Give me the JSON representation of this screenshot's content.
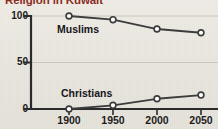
{
  "figure": {
    "title": "Religion in Kuwait",
    "title_color": "#8a2d24",
    "background_color": "#eceae2",
    "line_color": "#3c3c3c",
    "marker_fill": "#ffffff",
    "axis_color": "#2b2b2b",
    "gridline_color": "#c9c5ba"
  },
  "axes": {
    "y_ticks": [
      "0",
      "50",
      "100"
    ],
    "x_ticks": [
      "1900",
      "1950",
      "2000",
      "2050"
    ]
  },
  "series_labels": {
    "muslims": "Muslims",
    "christians": "Christians"
  },
  "chart_data": {
    "type": "line",
    "title": "Religion in Kuwait",
    "xlabel": "",
    "ylabel": "",
    "x": [
      1900,
      1950,
      2000,
      2050
    ],
    "categories": [
      "1900",
      "1950",
      "2000",
      "2050"
    ],
    "series": [
      {
        "name": "Muslims",
        "values": [
          100,
          96,
          86,
          82
        ]
      },
      {
        "name": "Christians",
        "values": [
          0,
          4,
          11,
          15
        ]
      }
    ],
    "xlim": [
      1875,
      2075
    ],
    "ylim": [
      0,
      100
    ],
    "y_ticks": [
      0,
      50,
      100
    ],
    "x_ticks": [
      1900,
      1950,
      2000,
      2050
    ],
    "grid": true,
    "grid_axis": "y",
    "legend": "inline-labels",
    "marker": "open-circle"
  }
}
